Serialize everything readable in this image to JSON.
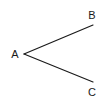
{
  "diagram": {
    "type": "angle",
    "vertex": {
      "label": "A",
      "x": 24,
      "y": 54,
      "label_x": 15,
      "label_y": 58
    },
    "rays": [
      {
        "to": "B",
        "end_x": 93,
        "end_y": 25,
        "label": "B",
        "label_x": 92,
        "label_y": 19
      },
      {
        "to": "C",
        "end_x": 93,
        "end_y": 82,
        "label": "C",
        "label_x": 92,
        "label_y": 96
      }
    ],
    "stroke_color": "#1a1a1a",
    "background": "#ffffff"
  }
}
